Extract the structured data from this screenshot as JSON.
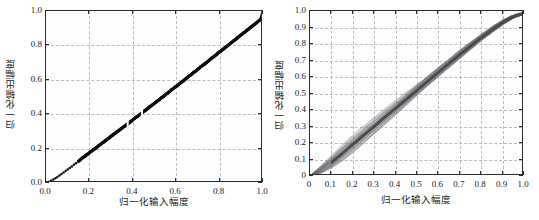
{
  "figure": {
    "background_color": "#ffffff",
    "axis_color": "#2b2b2b",
    "panels": [
      {
        "id": "left",
        "name": "am-am-characteristic",
        "marker_color": "#0d0d0d",
        "grid_color": "#d2d2d2",
        "grid_style": "solid"
      },
      {
        "id": "right",
        "name": "am-am-with-memory",
        "marker_color": "#6e6e72",
        "grid_color": "#b9bcc4",
        "grid_style": "dashed"
      }
    ]
  },
  "chart_data": [
    {
      "type": "scatter",
      "id": "left",
      "title": "",
      "xlabel": "归一化输入幅度",
      "ylabel": "归一化输出幅度",
      "xlim": [
        0.0,
        1.0
      ],
      "ylim": [
        0.0,
        1.0
      ],
      "grid": true,
      "grid_step": 0.2,
      "legend": "none",
      "xticks": [
        0.0,
        0.2,
        0.4,
        0.6,
        0.8,
        1.0
      ],
      "yticks": [
        0.0,
        0.2,
        0.4,
        0.6,
        0.8,
        1.0
      ],
      "xticklabels": [
        "0.0",
        "0.2",
        "0.4",
        "0.6",
        "0.8",
        "1.0"
      ],
      "yticklabels": [
        "0.0",
        "0.2",
        "0.4",
        "0.6",
        "0.8",
        "1.0"
      ],
      "marker": "dot",
      "marker_color": "#0d0d0d",
      "description": "Dense black single-valued AM/AM curve, slightly concave-up below 0.15 with sparse isolated samples, near-linear above 0.15, reaching (1.0,1.0).",
      "x": [
        0.005,
        0.012,
        0.02,
        0.028,
        0.036,
        0.045,
        0.055,
        0.065,
        0.075,
        0.088,
        0.1,
        0.112,
        0.125,
        0.138,
        0.15,
        0.165,
        0.18,
        0.195,
        0.21,
        0.225,
        0.24,
        0.255,
        0.27,
        0.285,
        0.3,
        0.315,
        0.33,
        0.345,
        0.36,
        0.375,
        0.39,
        0.405,
        0.42,
        0.435,
        0.45,
        0.465,
        0.48,
        0.495,
        0.51,
        0.525,
        0.54,
        0.555,
        0.57,
        0.585,
        0.6,
        0.615,
        0.63,
        0.645,
        0.66,
        0.675,
        0.69,
        0.705,
        0.72,
        0.735,
        0.75,
        0.765,
        0.78,
        0.795,
        0.81,
        0.825,
        0.84,
        0.855,
        0.87,
        0.885,
        0.9,
        0.915,
        0.93,
        0.945,
        0.96,
        0.975,
        0.99,
        1.0
      ],
      "y": [
        0.002,
        0.006,
        0.01,
        0.016,
        0.022,
        0.029,
        0.037,
        0.046,
        0.055,
        0.067,
        0.078,
        0.09,
        0.102,
        0.115,
        0.128,
        0.143,
        0.157,
        0.171,
        0.186,
        0.2,
        0.214,
        0.229,
        0.243,
        0.257,
        0.272,
        0.286,
        0.3,
        0.315,
        0.329,
        0.343,
        0.358,
        0.372,
        0.387,
        0.401,
        0.416,
        0.43,
        0.445,
        0.459,
        0.474,
        0.489,
        0.503,
        0.518,
        0.533,
        0.548,
        0.562,
        0.577,
        0.592,
        0.607,
        0.622,
        0.637,
        0.652,
        0.667,
        0.682,
        0.697,
        0.712,
        0.727,
        0.742,
        0.757,
        0.772,
        0.787,
        0.802,
        0.817,
        0.832,
        0.847,
        0.862,
        0.877,
        0.892,
        0.907,
        0.922,
        0.937,
        0.952,
        1.0
      ]
    },
    {
      "type": "line",
      "id": "right",
      "title": "",
      "xlabel": "归一化输入幅度",
      "ylabel": "归一化输出幅度",
      "xlim": [
        0.0,
        1.0
      ],
      "ylim": [
        0.0,
        1.0
      ],
      "grid": true,
      "grid_step": 0.1,
      "legend": "none",
      "xticks": [
        0,
        0.1,
        0.2,
        0.3,
        0.4,
        0.5,
        0.6,
        0.7,
        0.8,
        0.9,
        1.0
      ],
      "yticks": [
        0,
        0.1,
        0.2,
        0.3,
        0.4,
        0.5,
        0.6,
        0.7,
        0.8,
        0.9,
        1.0
      ],
      "xticklabels": [
        "0",
        "0.1",
        "0.2",
        "0.3",
        "0.4",
        "0.5",
        "0.6",
        "0.7",
        "0.8",
        "0.9",
        "1.0"
      ],
      "yticklabels": [
        "0",
        "0.1",
        "0.2",
        "0.3",
        "0.4",
        "0.5",
        "0.6",
        "0.7",
        "0.8",
        "0.9",
        "1.0"
      ],
      "marker": "thin-line",
      "marker_color": "#6e6e72",
      "description": "Hysteresis (memory-effect) band: many thin gray loop traces spreading into a wide lens near the origin, narrowing into a dense diagonal band, flattening/saturating above 0.95.",
      "x": [
        0.0,
        0.05,
        0.1,
        0.15,
        0.2,
        0.25,
        0.3,
        0.35,
        0.4,
        0.45,
        0.5,
        0.55,
        0.6,
        0.65,
        0.7,
        0.75,
        0.8,
        0.85,
        0.9,
        0.95,
        1.0
      ],
      "series": [
        {
          "name": "upper-branch",
          "values": [
            0.0,
            0.055,
            0.115,
            0.175,
            0.232,
            0.285,
            0.338,
            0.392,
            0.445,
            0.498,
            0.552,
            0.605,
            0.658,
            0.71,
            0.762,
            0.812,
            0.86,
            0.905,
            0.945,
            0.975,
            0.99
          ]
        },
        {
          "name": "lower-branch",
          "values": [
            0.0,
            0.018,
            0.052,
            0.098,
            0.152,
            0.208,
            0.265,
            0.322,
            0.378,
            0.434,
            0.49,
            0.546,
            0.602,
            0.657,
            0.712,
            0.766,
            0.818,
            0.868,
            0.915,
            0.958,
            0.985
          ]
        },
        {
          "name": "mean-branch",
          "values": [
            0.0,
            0.036,
            0.084,
            0.137,
            0.192,
            0.247,
            0.302,
            0.357,
            0.412,
            0.466,
            0.521,
            0.576,
            0.63,
            0.684,
            0.737,
            0.789,
            0.839,
            0.887,
            0.93,
            0.967,
            0.988
          ]
        }
      ]
    }
  ]
}
